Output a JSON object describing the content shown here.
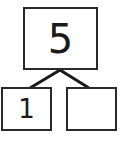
{
  "number_bond": {
    "whole": "5",
    "parts": [
      {
        "value": "1"
      },
      {
        "value": ""
      }
    ]
  },
  "colors": {
    "stroke": "#2a2a2a",
    "background": "#ffffff"
  }
}
